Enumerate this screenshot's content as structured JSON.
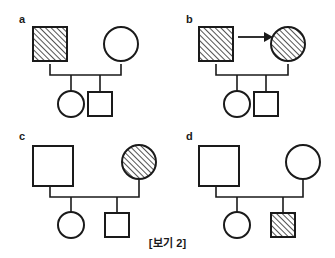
{
  "figure": {
    "caption": "[보기 2]",
    "background_color": "#ffffff",
    "line_color": "#1a1a1a",
    "hatch_description": "45-degree diagonal hatching, lower-left to upper-right"
  },
  "panels": [
    {
      "label": "a",
      "father": {
        "shape": "square",
        "fill": "hatched"
      },
      "mother": {
        "shape": "circle",
        "fill": "empty"
      },
      "arrow": false,
      "children": [
        {
          "shape": "circle",
          "fill": "empty"
        },
        {
          "shape": "square",
          "fill": "empty"
        }
      ]
    },
    {
      "label": "b",
      "father": {
        "shape": "square",
        "fill": "hatched"
      },
      "mother": {
        "shape": "circle",
        "fill": "hatched"
      },
      "arrow": true,
      "arrow_direction": "father-to-mother",
      "children": [
        {
          "shape": "circle",
          "fill": "empty"
        },
        {
          "shape": "square",
          "fill": "empty"
        }
      ]
    },
    {
      "label": "c",
      "father": {
        "shape": "square",
        "fill": "empty"
      },
      "mother": {
        "shape": "circle",
        "fill": "hatched"
      },
      "arrow": false,
      "children": [
        {
          "shape": "circle",
          "fill": "empty"
        },
        {
          "shape": "square",
          "fill": "empty"
        }
      ]
    },
    {
      "label": "d",
      "father": {
        "shape": "square",
        "fill": "empty"
      },
      "mother": {
        "shape": "circle",
        "fill": "empty"
      },
      "arrow": false,
      "children": [
        {
          "shape": "circle",
          "fill": "empty"
        },
        {
          "shape": "square",
          "fill": "hatched"
        }
      ]
    }
  ]
}
